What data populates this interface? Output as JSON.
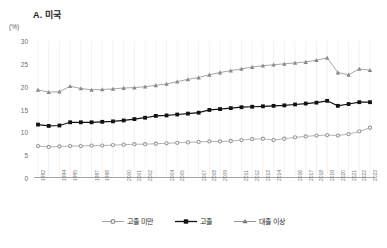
{
  "panel": {
    "title": "A. 미국",
    "unit": "(%)"
  },
  "legend": {
    "position": "bottom-center",
    "items": [
      {
        "label": "고졸 미만",
        "marker": "circle-open-grey",
        "color": "#8c8c8c"
      },
      {
        "label": "고졸",
        "marker": "square-filled-black",
        "color": "#111111"
      },
      {
        "label": "대졸 이상",
        "marker": "triangle-grey",
        "color": "#7a7a7a"
      }
    ]
  },
  "chart_data": {
    "type": "line",
    "title": "A. 미국",
    "xlabel": "",
    "ylabel": "(%)",
    "ylim": [
      0,
      30
    ],
    "yticks": [
      0,
      5,
      10,
      15,
      20,
      25,
      30
    ],
    "grid": "vertical-light",
    "x": [
      "1992",
      "1993",
      "1994",
      "1995",
      "1996",
      "1997",
      "1998",
      "1999",
      "2000",
      "2001",
      "2002",
      "2003",
      "2004",
      "2005",
      "2006",
      "2007",
      "2008",
      "2009",
      "2010",
      "2011",
      "2012",
      "2013",
      "2014",
      "2015",
      "2016",
      "2017",
      "2018",
      "2019",
      "2020",
      "2021",
      "2022",
      "2023"
    ],
    "xtick_labels_shown": [
      "1992",
      "1994",
      "1995",
      "1997",
      "1998",
      "2000",
      "2001",
      "2002",
      "2004",
      "2005",
      "2007",
      "2008",
      "2009",
      "2011",
      "2012",
      "2013",
      "2014",
      "2016",
      "2017",
      "2018",
      "2019",
      "2020",
      "2021",
      "2022",
      "2023"
    ],
    "series": [
      {
        "name": "고졸 미만",
        "marker": "circle",
        "color": "#9a9a9a",
        "values": [
          7.0,
          6.8,
          6.9,
          7.0,
          7.0,
          7.1,
          7.1,
          7.2,
          7.3,
          7.4,
          7.4,
          7.5,
          7.6,
          7.7,
          7.8,
          7.9,
          8.0,
          8.0,
          8.1,
          8.3,
          8.5,
          8.6,
          8.3,
          8.6,
          8.9,
          9.1,
          9.3,
          9.4,
          9.3,
          9.6,
          10.2,
          11.0
        ]
      },
      {
        "name": "고졸",
        "marker": "square",
        "color": "#111111",
        "values": [
          11.7,
          11.4,
          11.5,
          12.2,
          12.2,
          12.2,
          12.3,
          12.4,
          12.6,
          12.9,
          13.2,
          13.6,
          13.7,
          13.9,
          14.1,
          14.3,
          14.9,
          15.1,
          15.3,
          15.5,
          15.6,
          15.7,
          15.8,
          15.9,
          16.1,
          16.3,
          16.5,
          16.9,
          15.8,
          16.2,
          16.6,
          16.6
        ]
      },
      {
        "name": "대졸 이상",
        "marker": "triangle",
        "color": "#8a8a8a",
        "values": [
          19.3,
          18.8,
          18.9,
          20.1,
          19.6,
          19.3,
          19.4,
          19.5,
          19.7,
          19.8,
          20.0,
          20.3,
          20.6,
          21.1,
          21.6,
          22.0,
          22.6,
          23.1,
          23.5,
          23.9,
          24.3,
          24.6,
          24.8,
          25.0,
          25.2,
          25.4,
          25.8,
          26.3,
          23.1,
          22.6,
          23.9,
          23.6
        ]
      }
    ]
  }
}
